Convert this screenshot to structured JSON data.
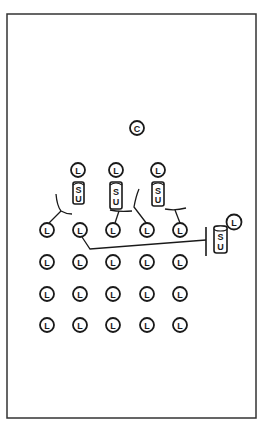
{
  "diagram": {
    "frame": {
      "x": 7,
      "y": 14,
      "width": 249,
      "height": 404,
      "stroke": "#333333"
    },
    "colors": {
      "line": "#1a1a1a",
      "background": "#ffffff"
    },
    "central_node": {
      "label": "C",
      "x": 137,
      "y": 128,
      "r": 7
    },
    "upper_units": [
      {
        "lamp_label": "L",
        "unit_label_top": "S",
        "unit_label_bottom": "U",
        "x": 78,
        "y": 170
      },
      {
        "lamp_label": "L",
        "unit_label_top": "S",
        "unit_label_bottom": "U",
        "x": 116,
        "y": 170
      },
      {
        "lamp_label": "L",
        "unit_label_top": "S",
        "unit_label_bottom": "U",
        "x": 158,
        "y": 170
      }
    ],
    "right_unit": {
      "lamp_label": "L",
      "unit_label_top": "S",
      "unit_label_bottom": "U",
      "lamp_x": 234,
      "lamp_y": 222,
      "unit_x": 214,
      "unit_y": 225
    },
    "grid": {
      "label": "L",
      "columns": [
        47,
        80,
        113,
        147,
        180
      ],
      "rows": [
        230,
        262,
        294,
        325
      ],
      "r": 7
    }
  }
}
